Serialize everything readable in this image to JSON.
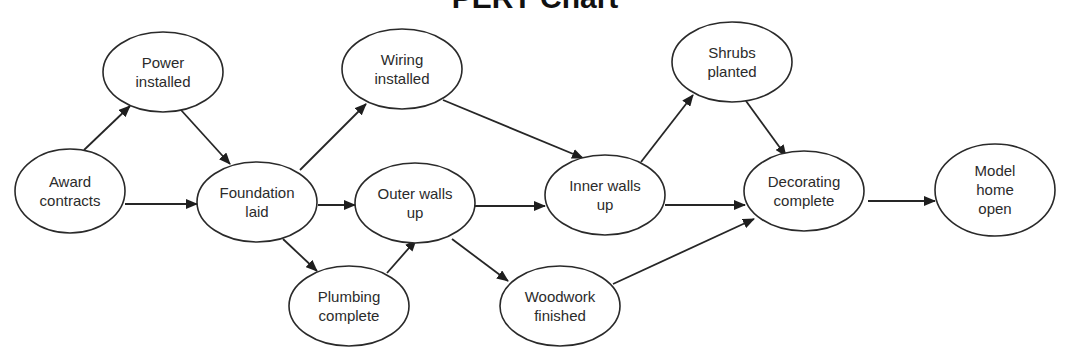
{
  "diagram": {
    "title": "PERT Chart",
    "type": "pert-chart",
    "nodes": [
      {
        "id": "award",
        "lines": [
          "Award",
          "contracts"
        ]
      },
      {
        "id": "power",
        "lines": [
          "Power",
          "installed"
        ]
      },
      {
        "id": "foundation",
        "lines": [
          "Foundation",
          "laid"
        ]
      },
      {
        "id": "wiring",
        "lines": [
          "Wiring",
          "installed"
        ]
      },
      {
        "id": "outer",
        "lines": [
          "Outer walls",
          "up"
        ]
      },
      {
        "id": "plumbing",
        "lines": [
          "Plumbing",
          "complete"
        ]
      },
      {
        "id": "woodwork",
        "lines": [
          "Woodwork",
          "finished"
        ]
      },
      {
        "id": "inner",
        "lines": [
          "Inner walls",
          "up"
        ]
      },
      {
        "id": "shrubs",
        "lines": [
          "Shrubs",
          "planted"
        ]
      },
      {
        "id": "decorating",
        "lines": [
          "Decorating",
          "complete"
        ]
      },
      {
        "id": "model",
        "lines": [
          "Model",
          "home",
          "open"
        ]
      }
    ],
    "edges": [
      {
        "from": "award",
        "to": "power"
      },
      {
        "from": "award",
        "to": "foundation"
      },
      {
        "from": "power",
        "to": "foundation"
      },
      {
        "from": "foundation",
        "to": "wiring"
      },
      {
        "from": "foundation",
        "to": "outer"
      },
      {
        "from": "foundation",
        "to": "plumbing"
      },
      {
        "from": "plumbing",
        "to": "outer"
      },
      {
        "from": "wiring",
        "to": "inner"
      },
      {
        "from": "outer",
        "to": "inner"
      },
      {
        "from": "outer",
        "to": "woodwork"
      },
      {
        "from": "inner",
        "to": "shrubs"
      },
      {
        "from": "inner",
        "to": "decorating"
      },
      {
        "from": "shrubs",
        "to": "decorating"
      },
      {
        "from": "woodwork",
        "to": "decorating"
      },
      {
        "from": "decorating",
        "to": "model"
      }
    ],
    "colors": {
      "stroke": "#2a2a2a",
      "text": "#2b2b2b",
      "background": "#ffffff"
    }
  }
}
